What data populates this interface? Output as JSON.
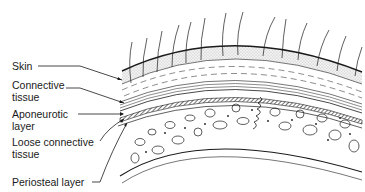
{
  "diagram": {
    "labels": [
      {
        "id": "skin",
        "lines": [
          "Skin"
        ]
      },
      {
        "id": "connective-tissue",
        "lines": [
          "Connective",
          "tissue"
        ]
      },
      {
        "id": "aponeurotic-layer",
        "lines": [
          "Aponeurotic",
          "layer"
        ]
      },
      {
        "id": "loose-connective-tissue",
        "lines": [
          "Loose connective",
          "tissue"
        ]
      },
      {
        "id": "periosteal-layer",
        "lines": [
          "Periosteal layer"
        ]
      }
    ],
    "colors": {
      "ink": "#1a1a1a",
      "skin_stipple": "#cfcfcf",
      "background": "#ffffff"
    }
  }
}
